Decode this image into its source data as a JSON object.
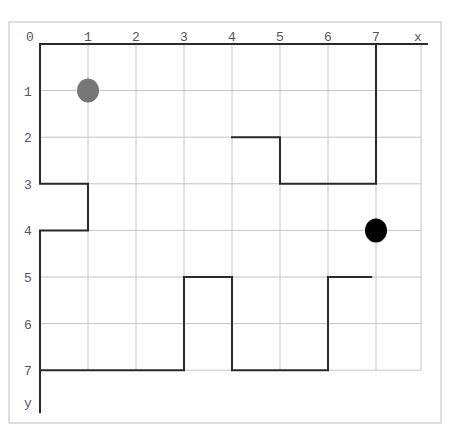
{
  "diagram": {
    "type": "grid-maze",
    "axes": {
      "x_label": "x",
      "y_label": "y",
      "x_ticks": [
        "0",
        "1",
        "2",
        "3",
        "4",
        "5",
        "6",
        "7"
      ],
      "y_ticks": [
        "1",
        "2",
        "3",
        "4",
        "5",
        "6",
        "7"
      ]
    },
    "grid": {
      "columns": 8,
      "rows": 7,
      "cell_px": 48
    },
    "markers": [
      {
        "name": "start-marker",
        "x": 1,
        "y": 1,
        "color": "#777777"
      },
      {
        "name": "goal-marker",
        "x": 7,
        "y": 4,
        "color": "#000000"
      }
    ],
    "walls": [
      {
        "points": [
          [
            0,
            0
          ],
          [
            7,
            0
          ]
        ]
      },
      {
        "points": [
          [
            7,
            0
          ],
          [
            7,
            3
          ],
          [
            5,
            3
          ],
          [
            5,
            2
          ],
          [
            4,
            2
          ]
        ]
      },
      {
        "points": [
          [
            0,
            0
          ],
          [
            0,
            3
          ],
          [
            1,
            3
          ],
          [
            1,
            4
          ],
          [
            0,
            4
          ],
          [
            0,
            7.9
          ]
        ]
      },
      {
        "points": [
          [
            0,
            7
          ],
          [
            3,
            7
          ],
          [
            3,
            5
          ],
          [
            4,
            5
          ],
          [
            4,
            7
          ],
          [
            6,
            7
          ],
          [
            6,
            5
          ],
          [
            6.9,
            5
          ]
        ]
      }
    ],
    "colors": {
      "wall": "#2a2a2a",
      "grid": "#c4c4c4",
      "frame": "#c8c8c8",
      "label": "#555555"
    }
  }
}
